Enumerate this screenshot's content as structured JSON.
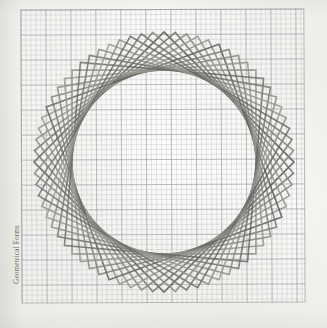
{
  "page": {
    "margin_label": "Geometrical Forms",
    "bottom_caption": "",
    "background_color": "#f7f7f4"
  },
  "grid": {
    "minor_cell_px": 5,
    "major_cell_px": 25,
    "minor_color": "#a8b0b2",
    "major_color": "#969ea0",
    "border_color": "#8c9496",
    "left": 21,
    "top": 9,
    "width": 284,
    "height": 294
  },
  "chart_data": {
    "type": "line",
    "title": "Geometrical Forms",
    "subtitle": "Rosette of rotated squares inscribed about a common centre",
    "xlabel": "",
    "ylabel": "",
    "grid": true,
    "legend": "none",
    "center": {
      "x": 164,
      "y": 162
    },
    "square_half_diagonal": 130,
    "square_count": 18,
    "rotation_step_deg": 5,
    "rotation_start_deg": 0,
    "stroke_colors": [
      "#5a5a58",
      "#6e6e6a",
      "#82827c",
      "#96968e",
      "#8a8f86"
    ],
    "stroke_width": 1.6,
    "envelope_circle": {
      "center_x": 164,
      "center_y": 162,
      "radius": 92,
      "color": "#8e8e88"
    },
    "series": [
      {
        "name": "square-01",
        "rotation_deg": 0,
        "opacity": 0.92
      },
      {
        "name": "square-02",
        "rotation_deg": 5,
        "opacity": 0.88
      },
      {
        "name": "square-03",
        "rotation_deg": 10,
        "opacity": 0.86
      },
      {
        "name": "square-04",
        "rotation_deg": 15,
        "opacity": 0.9
      },
      {
        "name": "square-05",
        "rotation_deg": 20,
        "opacity": 0.84
      },
      {
        "name": "square-06",
        "rotation_deg": 25,
        "opacity": 0.88
      },
      {
        "name": "square-07",
        "rotation_deg": 30,
        "opacity": 0.8
      },
      {
        "name": "square-08",
        "rotation_deg": 35,
        "opacity": 0.86
      },
      {
        "name": "square-09",
        "rotation_deg": 40,
        "opacity": 0.9
      },
      {
        "name": "square-10",
        "rotation_deg": 45,
        "opacity": 0.84
      },
      {
        "name": "square-11",
        "rotation_deg": 50,
        "opacity": 0.78
      },
      {
        "name": "square-12",
        "rotation_deg": 55,
        "opacity": 0.88
      },
      {
        "name": "square-13",
        "rotation_deg": 60,
        "opacity": 0.82
      },
      {
        "name": "square-14",
        "rotation_deg": 65,
        "opacity": 0.86
      },
      {
        "name": "square-15",
        "rotation_deg": 70,
        "opacity": 0.9
      },
      {
        "name": "square-16",
        "rotation_deg": 75,
        "opacity": 0.8
      },
      {
        "name": "square-17",
        "rotation_deg": 80,
        "opacity": 0.86
      },
      {
        "name": "square-18",
        "rotation_deg": 85,
        "opacity": 0.88
      }
    ]
  }
}
